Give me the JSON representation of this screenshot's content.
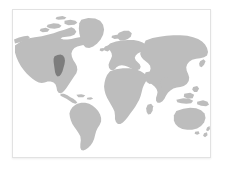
{
  "widget": {
    "name": "world-map-locator",
    "title": "World Map",
    "description": "Grey world map with one highlighted region in the eastern United States"
  },
  "frame": {
    "border_color": "#e2e2e2",
    "background_color": "#ffffff"
  },
  "map": {
    "projection": "equirectangular",
    "land_color": "#bdbdbd",
    "ocean_color": "#ffffff",
    "highlight_color": "#7d7d7d",
    "highlighted_region_label": "Eastern United States",
    "regions": [
      {
        "name": "north-america",
        "label": "North America",
        "highlighted": false
      },
      {
        "name": "south-america",
        "label": "South America",
        "highlighted": false
      },
      {
        "name": "greenland",
        "label": "Greenland",
        "highlighted": false
      },
      {
        "name": "europe",
        "label": "Europe",
        "highlighted": false
      },
      {
        "name": "africa",
        "label": "Africa",
        "highlighted": false
      },
      {
        "name": "asia",
        "label": "Asia",
        "highlighted": false
      },
      {
        "name": "australia",
        "label": "Australia",
        "highlighted": false
      },
      {
        "name": "new-zealand",
        "label": "New Zealand",
        "highlighted": false
      },
      {
        "name": "japan",
        "label": "Japan",
        "highlighted": false
      },
      {
        "name": "indonesia",
        "label": "Indonesia",
        "highlighted": false
      },
      {
        "name": "madagascar",
        "label": "Madagascar",
        "highlighted": false
      },
      {
        "name": "british-isles",
        "label": "British Isles",
        "highlighted": false
      },
      {
        "name": "iceland",
        "label": "Iceland",
        "highlighted": false
      },
      {
        "name": "eastern-united-states",
        "label": "Eastern United States",
        "highlighted": true
      }
    ]
  }
}
